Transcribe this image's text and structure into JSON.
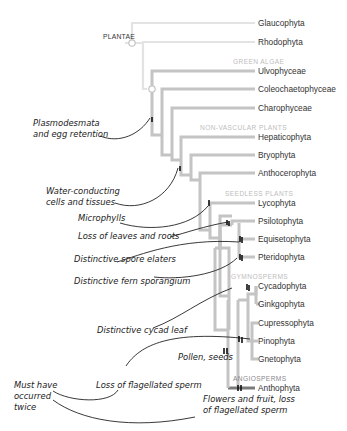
{
  "root_label": "PLANTAE",
  "groups": {
    "green_algae": "GREEN ALGAE",
    "non_vascular": "NON-VASCULAR PLANTS",
    "seedless": "SEEDLESS PLANTS",
    "gymnosperms": "GYMNOSPERMS",
    "angiosperms": "ANGIOSPERMS"
  },
  "taxa": [
    "Glaucophyta",
    "Rhodophyta",
    "Ulvophyceae",
    "Coleochaetophyceae",
    "Charophyceae",
    "Hepaticophyta",
    "Bryophyta",
    "Anthocerophyta",
    "Lycophyta",
    "Psilotophyta",
    "Equisetophyta",
    "Pteridophyta",
    "Cycadophyta",
    "Ginkgophyta",
    "Cupressophyta",
    "Pinophyta",
    "Gnetophyta",
    "Anthophyta"
  ],
  "annotations": {
    "plasmodesmata": [
      "Plasmodesmata",
      "and egg retention"
    ],
    "water": [
      "Water-conducting",
      "cells and tissues"
    ],
    "microphylls": "Microphylls",
    "loss_leaves": "Loss of leaves and roots",
    "spore_elaters": "Distinctive spore elaters",
    "fern_sporangium": "Distinctive fern sporangium",
    "cycad_leaf": "Distinctive cycad leaf",
    "pollen_seeds": "Pollen, seeds",
    "loss_flagellated": "Loss of flagellated sperm",
    "must_have": [
      "Must have",
      "occurred",
      "twice"
    ],
    "flowers": [
      "Flowers and fruit, loss",
      "of flagellated sperm"
    ]
  },
  "colors": {
    "branch_light": "#e0e0e0",
    "branch_mid": "#bdbdbd",
    "branch_dark": "#6d6d6d",
    "group_header": "#bdbdbd",
    "angiosperm_header": "#8a8a8a",
    "annotation_ink": "#222222"
  }
}
